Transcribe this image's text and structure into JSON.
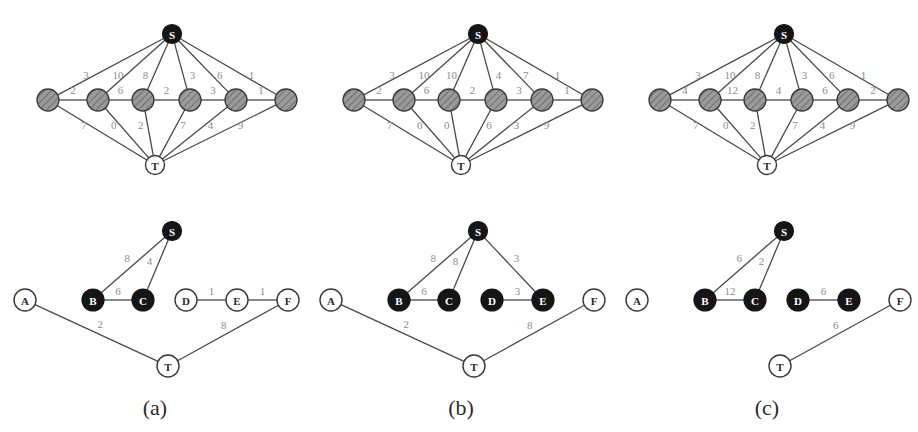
{
  "figure": {
    "width": 918,
    "height": 432,
    "background": "#ffffff",
    "edge_color": "#4a4a4a",
    "weight_label_color": "#8d8d8d",
    "node_black_fill": "#151515",
    "node_open_fill": "#ffffff",
    "node_hatch_fill": "#9a9a9a"
  },
  "chart_data": {
    "type": "diagram",
    "title": "",
    "panels": [
      {
        "caption": "(a)",
        "top_graph": {
          "source_label": "S",
          "sink_label": "T",
          "middle_nodes": [
            "",
            "",
            "",
            "",
            "",
            ""
          ],
          "source_edge_weights": [
            "3",
            "10",
            "8",
            "3",
            "6",
            "1"
          ],
          "chain_edge_weights": [
            "2",
            "6",
            "2",
            "3",
            "1"
          ],
          "sink_edge_weights": [
            "7",
            "0",
            "2",
            "7",
            "4",
            "9"
          ]
        },
        "bottom_graph": {
          "nodes": [
            {
              "id": "S",
              "label": "S",
              "style": "black"
            },
            {
              "id": "A",
              "label": "A",
              "style": "open"
            },
            {
              "id": "B",
              "label": "B",
              "style": "black"
            },
            {
              "id": "C",
              "label": "C",
              "style": "black"
            },
            {
              "id": "D",
              "label": "D",
              "style": "open"
            },
            {
              "id": "E",
              "label": "E",
              "style": "open"
            },
            {
              "id": "F",
              "label": "F",
              "style": "open"
            },
            {
              "id": "T",
              "label": "T",
              "style": "open"
            }
          ],
          "edges": [
            {
              "from": "S",
              "to": "B",
              "weight": "8"
            },
            {
              "from": "S",
              "to": "C",
              "weight": "4"
            },
            {
              "from": "B",
              "to": "C",
              "weight": "6"
            },
            {
              "from": "D",
              "to": "E",
              "weight": "1"
            },
            {
              "from": "E",
              "to": "F",
              "weight": "1"
            },
            {
              "from": "A",
              "to": "T",
              "weight": "2"
            },
            {
              "from": "T",
              "to": "F",
              "weight": "8"
            }
          ]
        }
      },
      {
        "caption": "(b)",
        "top_graph": {
          "source_label": "S",
          "sink_label": "T",
          "middle_nodes": [
            "",
            "",
            "",
            "",
            "",
            ""
          ],
          "source_edge_weights": [
            "3",
            "10",
            "10",
            "4",
            "7",
            "1"
          ],
          "chain_edge_weights": [
            "2",
            "6",
            "2",
            "3",
            "1"
          ],
          "sink_edge_weights": [
            "7",
            "0",
            "0",
            "6",
            "3",
            "9"
          ]
        },
        "bottom_graph": {
          "nodes": [
            {
              "id": "S",
              "label": "S",
              "style": "black"
            },
            {
              "id": "A",
              "label": "A",
              "style": "open"
            },
            {
              "id": "B",
              "label": "B",
              "style": "black"
            },
            {
              "id": "C",
              "label": "C",
              "style": "black"
            },
            {
              "id": "D",
              "label": "D",
              "style": "black"
            },
            {
              "id": "E",
              "label": "E",
              "style": "black"
            },
            {
              "id": "F",
              "label": "F",
              "style": "open"
            },
            {
              "id": "T",
              "label": "T",
              "style": "open"
            }
          ],
          "edges": [
            {
              "from": "S",
              "to": "B",
              "weight": "8"
            },
            {
              "from": "S",
              "to": "C",
              "weight": "8"
            },
            {
              "from": "S",
              "to": "E",
              "weight": "3"
            },
            {
              "from": "B",
              "to": "C",
              "weight": "6"
            },
            {
              "from": "D",
              "to": "E",
              "weight": "3"
            },
            {
              "from": "A",
              "to": "T",
              "weight": "2"
            },
            {
              "from": "T",
              "to": "F",
              "weight": "8"
            }
          ]
        }
      },
      {
        "caption": "(c)",
        "top_graph": {
          "source_label": "S",
          "sink_label": "T",
          "middle_nodes": [
            "",
            "",
            "",
            "",
            "",
            ""
          ],
          "source_edge_weights": [
            "3",
            "10",
            "8",
            "3",
            "6",
            "1"
          ],
          "chain_edge_weights": [
            "4",
            "12",
            "4",
            "6",
            "2"
          ],
          "sink_edge_weights": [
            "7",
            "0",
            "2",
            "7",
            "4",
            "9"
          ]
        },
        "bottom_graph": {
          "nodes": [
            {
              "id": "S",
              "label": "S",
              "style": "black"
            },
            {
              "id": "A",
              "label": "A",
              "style": "open"
            },
            {
              "id": "B",
              "label": "B",
              "style": "black"
            },
            {
              "id": "C",
              "label": "C",
              "style": "black"
            },
            {
              "id": "D",
              "label": "D",
              "style": "black"
            },
            {
              "id": "E",
              "label": "E",
              "style": "black"
            },
            {
              "id": "F",
              "label": "F",
              "style": "open"
            },
            {
              "id": "T",
              "label": "T",
              "style": "open"
            }
          ],
          "edges": [
            {
              "from": "S",
              "to": "B",
              "weight": "6"
            },
            {
              "from": "S",
              "to": "C",
              "weight": "2"
            },
            {
              "from": "B",
              "to": "C",
              "weight": "12"
            },
            {
              "from": "D",
              "to": "E",
              "weight": "6"
            },
            {
              "from": "T",
              "to": "F",
              "weight": "6"
            }
          ]
        }
      }
    ]
  },
  "captions": {
    "a": "(a)",
    "b": "(b)",
    "c": "(c)"
  }
}
